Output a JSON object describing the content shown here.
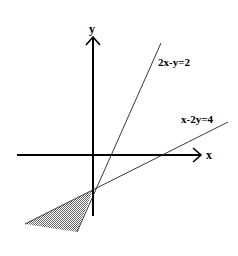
{
  "diagram": {
    "axes": {
      "x_label": "x",
      "y_label": "y",
      "origin": [
        93,
        155
      ]
    },
    "lines": [
      {
        "label": "2x-y=2",
        "from": [
          77,
          232
        ],
        "to": [
          161,
          43
        ]
      },
      {
        "label": "x-2y=4",
        "from": [
          25,
          224
        ],
        "to": [
          228,
          122
        ]
      }
    ],
    "shaded_region": {
      "description": "feasible region below both lines, left of intersection",
      "vertices": [
        [
          93,
          190
        ],
        [
          25,
          224
        ],
        [
          77,
          232
        ]
      ],
      "fill": "#9a9a9a"
    },
    "colors": {
      "axis": "#000000",
      "line": "#222222",
      "background": "#ffffff"
    }
  }
}
